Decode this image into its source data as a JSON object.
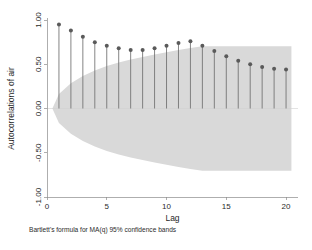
{
  "chart_data": {
    "type": "bar",
    "title": "",
    "subtitle": "",
    "xlabel": "Lag",
    "ylabel": "Autocorrelations of air",
    "footnote": "Bartlett's formula for MA(q) 95% confidence bands",
    "grid": false,
    "legend": "none",
    "xlim": [
      0,
      21
    ],
    "ylim": [
      -1.0,
      1.0
    ],
    "xticks": [
      0,
      5,
      10,
      15,
      20
    ],
    "xticklabels": [
      "0",
      "5",
      "10",
      "15",
      "20"
    ],
    "yticks": [
      -1.0,
      -0.5,
      0.0,
      0.5,
      1.0
    ],
    "yticklabels": [
      "-1.00",
      "-0.50",
      "0.00",
      "0.50",
      "1.00"
    ],
    "categories": [
      1,
      2,
      3,
      4,
      5,
      6,
      7,
      8,
      9,
      10,
      11,
      12,
      13,
      14,
      15,
      16,
      17,
      18,
      19,
      20
    ],
    "values": [
      0.95,
      0.88,
      0.81,
      0.75,
      0.71,
      0.68,
      0.66,
      0.66,
      0.68,
      0.71,
      0.74,
      0.76,
      0.71,
      0.65,
      0.59,
      0.54,
      0.5,
      0.47,
      0.45,
      0.44
    ],
    "confidence_band": {
      "label": "95% confidence band",
      "upper": [
        0.163,
        0.284,
        0.367,
        0.43,
        0.479,
        0.52,
        0.554,
        0.583,
        0.61,
        0.635,
        0.66,
        0.683,
        0.702,
        0.702,
        0.702,
        0.702,
        0.702,
        0.702,
        0.702,
        0.702
      ],
      "lower": [
        -0.163,
        -0.284,
        -0.367,
        -0.43,
        -0.479,
        -0.52,
        -0.554,
        -0.583,
        -0.61,
        -0.635,
        -0.66,
        -0.683,
        -0.702,
        -0.702,
        -0.702,
        -0.702,
        -0.702,
        -0.702,
        -0.702,
        -0.702
      ],
      "fill_color": "#d9d9d9"
    },
    "series_color": "#5a5a5a",
    "marker": "circle"
  }
}
